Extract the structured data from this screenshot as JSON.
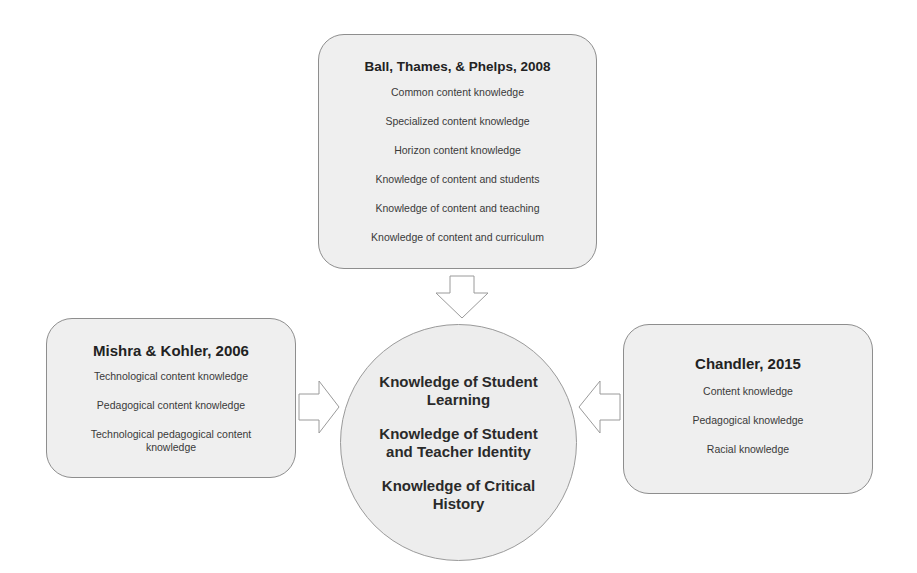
{
  "diagram": {
    "top_box": {
      "title": "Ball, Thames, & Phelps, 2008",
      "items": [
        "Common content knowledge",
        "Specialized content knowledge",
        "Horizon content knowledge",
        "Knowledge of content and students",
        "Knowledge of content and teaching",
        "Knowledge of content and curriculum"
      ]
    },
    "left_box": {
      "title": "Mishra & Kohler, 2006",
      "items": [
        "Technological content knowledge",
        "Pedagogical content knowledge",
        "Technological pedagogical content knowledge"
      ]
    },
    "right_box": {
      "title": "Chandler, 2015",
      "items": [
        "Content knowledge",
        "Pedagogical knowledge",
        "Racial knowledge"
      ]
    },
    "center": {
      "concepts": [
        "Knowledge of Student Learning",
        "Knowledge of Student and Teacher Identity",
        "Knowledge of Critical History"
      ]
    },
    "arrows": [
      {
        "from": "top_box",
        "to": "center",
        "direction": "down"
      },
      {
        "from": "left_box",
        "to": "center",
        "direction": "right"
      },
      {
        "from": "right_box",
        "to": "center",
        "direction": "left"
      }
    ],
    "colors": {
      "box_fill": "#efefef",
      "box_border": "#8e8e8e",
      "arrow_stroke": "#9a9a9a",
      "text": "#2a2a2a"
    }
  }
}
